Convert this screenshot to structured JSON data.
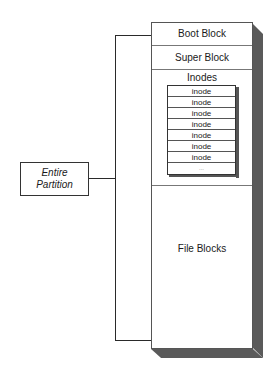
{
  "diagram": {
    "label": {
      "line1": "Entire",
      "line2": "Partition"
    },
    "sections": {
      "boot": "Boot Block",
      "super": "Super Block",
      "inodes": "Inodes",
      "file": "File Blocks"
    },
    "inode_rows": [
      "inode",
      "inode",
      "inode",
      "inode",
      "inode",
      "inode",
      "inode",
      "..."
    ]
  }
}
